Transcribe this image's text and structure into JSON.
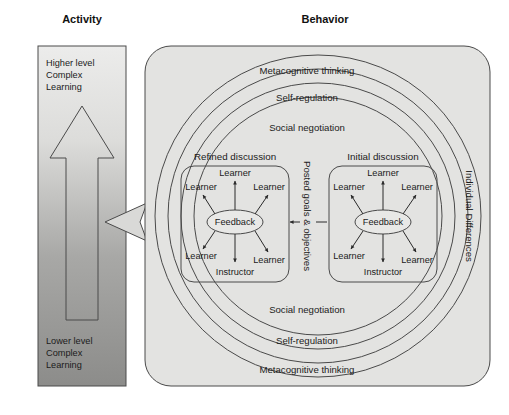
{
  "columns": {
    "activity": {
      "header": "Activity",
      "top_label": "Higher level\nComplex\nLearning",
      "top_label_lines": [
        "Higher level",
        "Complex",
        "Learning"
      ],
      "arrow_label": "Web 2.0 Application",
      "bottom_label_lines": [
        "Lower level",
        "Complex",
        "Learning"
      ]
    },
    "behavior": {
      "header": "Behavior"
    }
  },
  "rings": {
    "top": [
      "Metacognitive thinking",
      "Self-regulation",
      "Social negotiation"
    ],
    "bottom": [
      "Social negotiation",
      "Self-regulation",
      "Metacognitive thinking"
    ]
  },
  "side_labels": {
    "center": "Posted goals & objectives",
    "right": "Individual Differences"
  },
  "discussions": [
    {
      "id": "refined",
      "title": "Refined discussion",
      "center": "Feedback",
      "nodes": {
        "top": "Learner",
        "top_left": "Learner",
        "top_right": "Learner",
        "bottom_left": "Learner",
        "bottom_right": "Learner",
        "bottom": "Instructor"
      }
    },
    {
      "id": "initial",
      "title": "Initial discussion",
      "center": "Feedback",
      "nodes": {
        "top": "Learner",
        "top_left": "Learner",
        "top_right": "Learner",
        "bottom_left": "Learner",
        "bottom_right": "Learner",
        "bottom": "Instructor"
      }
    }
  ],
  "colors": {
    "panel_fill": "#e3e3e1",
    "stroke": "#4a4a4a",
    "activity_top": "#e0e0de",
    "activity_bottom": "#8f8f8f",
    "text": "#1b1b1b"
  }
}
